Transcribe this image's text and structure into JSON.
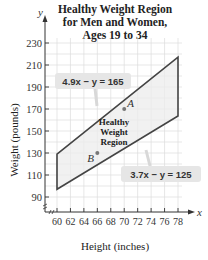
{
  "chart_data": {
    "type": "line",
    "title": "Healthy Weight Region for Men and Women, Ages 19 to 34",
    "title_lines": [
      "Healthy Weight Region",
      "for Men and Women,",
      "Ages 19 to 34"
    ],
    "xlabel": "Height (inches)",
    "ylabel": "Weight (pounds)",
    "x_axis_letter": "x",
    "y_axis_letter": "y",
    "xlim": [
      60,
      78
    ],
    "ylim": [
      90,
      230
    ],
    "x_ticks": [
      60,
      62,
      64,
      66,
      68,
      70,
      72,
      74,
      76,
      78
    ],
    "y_ticks": [
      90,
      110,
      130,
      150,
      170,
      190,
      210,
      230
    ],
    "grid": true,
    "region": {
      "label_lines": [
        "Healthy",
        "Weight",
        "Region"
      ],
      "vertices": [
        [
          60,
          129
        ],
        [
          78,
          217.2
        ],
        [
          78,
          163.6
        ],
        [
          60,
          97
        ]
      ],
      "fill": "#ececec",
      "stroke": "#444444"
    },
    "series": [
      {
        "name": "4.9x − y = 165",
        "x": [
          60,
          78
        ],
        "y": [
          129,
          217.2
        ]
      },
      {
        "name": "3.7x − y = 125",
        "x": [
          60,
          78
        ],
        "y": [
          97,
          163.6
        ]
      }
    ],
    "annotations": [
      {
        "text": "4.9x − y = 165",
        "type": "callout"
      },
      {
        "text": "3.7x − y = 125",
        "type": "callout"
      }
    ],
    "points": [
      {
        "label": "A",
        "x": 70,
        "y": 170
      },
      {
        "label": "B",
        "x": 66,
        "y": 130
      }
    ]
  }
}
